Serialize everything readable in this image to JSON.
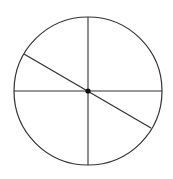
{
  "diagram": {
    "width": 173,
    "height": 179,
    "background": "#ffffff",
    "stroke_color": "#333333",
    "circle": {
      "cx": 88,
      "cy": 91,
      "r": 74,
      "stroke_width": 1.2
    },
    "center_point": {
      "cx": 88,
      "cy": 91,
      "r": 2.6,
      "fill": "#111111"
    },
    "lines": [
      {
        "name": "vertical-diameter",
        "x1": 88,
        "y1": 17,
        "x2": 88,
        "y2": 165,
        "stroke_width": 1.1
      },
      {
        "name": "horizontal-diameter",
        "x1": 14,
        "y1": 91,
        "x2": 162,
        "y2": 91,
        "stroke_width": 1.1
      },
      {
        "name": "diagonal-diameter",
        "x1": 24,
        "y1": 54,
        "x2": 151,
        "y2": 128,
        "stroke_width": 1.3
      }
    ]
  }
}
